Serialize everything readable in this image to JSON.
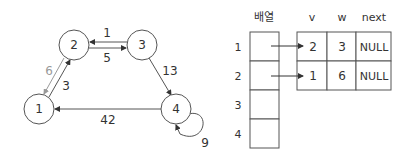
{
  "graph": {
    "nodes": [
      {
        "id": "1",
        "x": 39,
        "y": 109
      },
      {
        "id": "2",
        "x": 74,
        "y": 45
      },
      {
        "id": "3",
        "x": 142,
        "y": 45
      },
      {
        "id": "4",
        "x": 176,
        "y": 109
      }
    ],
    "edges": [
      {
        "from": "3",
        "to": "2",
        "weight": "1"
      },
      {
        "from": "2",
        "to": "3",
        "weight": "5"
      },
      {
        "from": "2",
        "to": "1",
        "weight": "6",
        "color": "#999999"
      },
      {
        "from": "1",
        "to": "2",
        "weight": "3"
      },
      {
        "from": "3",
        "to": "4",
        "weight": "13"
      },
      {
        "from": "4",
        "to": "1",
        "weight": "42"
      },
      {
        "from": "4",
        "to": "4",
        "weight": "9"
      }
    ]
  },
  "array": {
    "title": "배열",
    "indices": [
      "1",
      "2",
      "3",
      "4"
    ]
  },
  "list_table": {
    "headers": [
      "v",
      "w",
      "next"
    ],
    "rows": [
      [
        "2",
        "3",
        "NULL"
      ],
      [
        "1",
        "6",
        "NULL"
      ]
    ]
  }
}
